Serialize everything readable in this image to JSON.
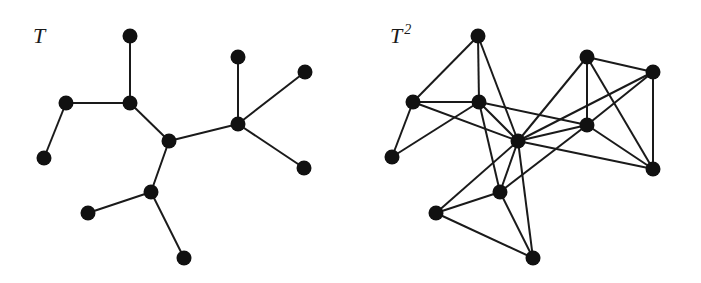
{
  "figure": {
    "background": "#ffffff",
    "ink_color": "#111111",
    "node_radius": 7.5
  },
  "graphs": [
    {
      "id": "T",
      "label": "T",
      "label_sup": "",
      "label_pos": [
        33,
        43
      ],
      "offset_x": 0,
      "nodes": [
        {
          "id": "a",
          "x": 130,
          "y": 36
        },
        {
          "id": "b",
          "x": 66,
          "y": 103
        },
        {
          "id": "c",
          "x": 130,
          "y": 103
        },
        {
          "id": "d",
          "x": 44,
          "y": 158
        },
        {
          "id": "e",
          "x": 169,
          "y": 141
        },
        {
          "id": "f",
          "x": 238,
          "y": 124
        },
        {
          "id": "g",
          "x": 238,
          "y": 57
        },
        {
          "id": "h",
          "x": 305,
          "y": 72
        },
        {
          "id": "i",
          "x": 304,
          "y": 168
        },
        {
          "id": "j",
          "x": 151,
          "y": 192
        },
        {
          "id": "k",
          "x": 88,
          "y": 213
        },
        {
          "id": "l",
          "x": 184,
          "y": 258
        }
      ],
      "edges": [
        [
          "a",
          "c"
        ],
        [
          "b",
          "c"
        ],
        [
          "b",
          "d"
        ],
        [
          "c",
          "e"
        ],
        [
          "e",
          "f"
        ],
        [
          "e",
          "j"
        ],
        [
          "f",
          "g"
        ],
        [
          "f",
          "h"
        ],
        [
          "f",
          "i"
        ],
        [
          "j",
          "k"
        ],
        [
          "j",
          "l"
        ]
      ]
    },
    {
      "id": "T2",
      "label": "T",
      "label_sup": "2",
      "label_pos": [
        390,
        43
      ],
      "offset_x": 0,
      "nodes": [
        {
          "id": "a",
          "x": 478,
          "y": 36
        },
        {
          "id": "b",
          "x": 413,
          "y": 102
        },
        {
          "id": "c",
          "x": 479,
          "y": 102
        },
        {
          "id": "d",
          "x": 392,
          "y": 157
        },
        {
          "id": "e",
          "x": 518,
          "y": 141
        },
        {
          "id": "f",
          "x": 587,
          "y": 125
        },
        {
          "id": "g",
          "x": 587,
          "y": 57
        },
        {
          "id": "h",
          "x": 653,
          "y": 72
        },
        {
          "id": "i",
          "x": 653,
          "y": 169
        },
        {
          "id": "j",
          "x": 500,
          "y": 192
        },
        {
          "id": "k",
          "x": 436,
          "y": 213
        },
        {
          "id": "l",
          "x": 533,
          "y": 258
        }
      ],
      "edges": [
        [
          "a",
          "c"
        ],
        [
          "b",
          "c"
        ],
        [
          "b",
          "d"
        ],
        [
          "c",
          "e"
        ],
        [
          "e",
          "f"
        ],
        [
          "e",
          "j"
        ],
        [
          "f",
          "g"
        ],
        [
          "f",
          "h"
        ],
        [
          "f",
          "i"
        ],
        [
          "j",
          "k"
        ],
        [
          "j",
          "l"
        ],
        [
          "a",
          "b"
        ],
        [
          "a",
          "e"
        ],
        [
          "c",
          "d"
        ],
        [
          "c",
          "f"
        ],
        [
          "c",
          "j"
        ],
        [
          "b",
          "e"
        ],
        [
          "e",
          "g"
        ],
        [
          "e",
          "h"
        ],
        [
          "e",
          "i"
        ],
        [
          "f",
          "j"
        ],
        [
          "e",
          "k"
        ],
        [
          "e",
          "l"
        ],
        [
          "g",
          "h"
        ],
        [
          "g",
          "i"
        ],
        [
          "h",
          "i"
        ],
        [
          "k",
          "l"
        ]
      ]
    }
  ]
}
